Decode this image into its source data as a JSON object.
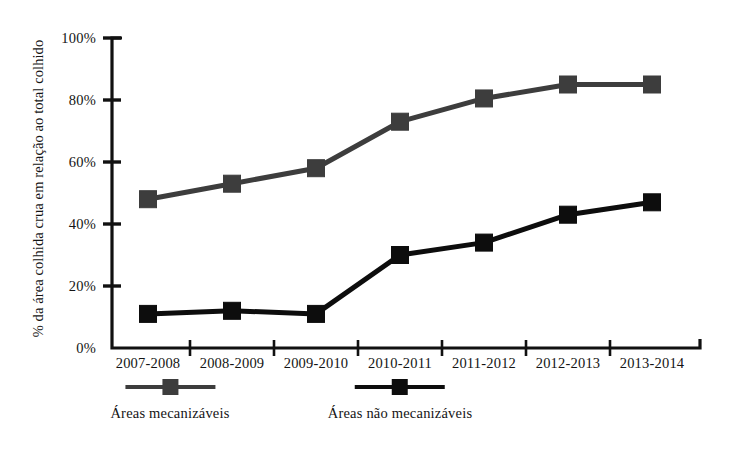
{
  "chart_data": {
    "type": "line",
    "title": "",
    "xlabel": "",
    "ylabel": "% da área colhida crua em relação ao total colhido",
    "categories": [
      "2007-2008",
      "2008-2009",
      "2009-2010",
      "2010-2011",
      "2011-2012",
      "2012-2013",
      "2013-2014"
    ],
    "ylim": [
      0,
      100
    ],
    "yticks": [
      0,
      20,
      40,
      60,
      80,
      100
    ],
    "ytick_labels": [
      "0%",
      "20%",
      "40%",
      "60%",
      "80%",
      "100%"
    ],
    "grid": false,
    "legend_position": "bottom",
    "series": [
      {
        "name": "Áreas mecanizáveis",
        "color": "#3d3d3d",
        "marker": "square",
        "values": [
          48,
          53,
          58,
          73,
          80.5,
          85,
          85
        ]
      },
      {
        "name": "Áreas não mecanizáveis",
        "color": "#0d0d0d",
        "marker": "square",
        "values": [
          11,
          12,
          11,
          30,
          34,
          43,
          47
        ]
      }
    ]
  },
  "axes": {
    "y_axis_title": "% da área colhida crua em relação ao total colhido",
    "tick_unit": "%"
  },
  "colors": {
    "series_1": "#3d3d3d",
    "series_2": "#0d0d0d",
    "axis": "#111111",
    "background": "#ffffff"
  }
}
